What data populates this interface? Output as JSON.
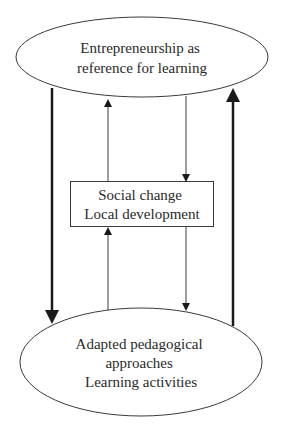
{
  "diagram": {
    "type": "cycle-flow",
    "nodes": {
      "top": {
        "shape": "ellipse",
        "lines": [
          "Entrepreneurship as",
          "reference for learning"
        ]
      },
      "middle": {
        "shape": "rectangle",
        "lines": [
          "Social change",
          "Local development"
        ]
      },
      "bottom": {
        "shape": "ellipse",
        "lines": [
          "Adapted pedagogical",
          "approaches",
          "Learning activities"
        ]
      }
    },
    "edges": [
      {
        "from": "top",
        "to": "bottom",
        "weight": "thick",
        "side": "left"
      },
      {
        "from": "bottom",
        "to": "top",
        "weight": "thick",
        "side": "right"
      },
      {
        "from": "middle",
        "to": "top",
        "weight": "thin"
      },
      {
        "from": "top",
        "to": "middle",
        "weight": "thin"
      },
      {
        "from": "bottom",
        "to": "middle",
        "weight": "thin"
      },
      {
        "from": "middle",
        "to": "bottom",
        "weight": "thin"
      }
    ],
    "colors": {
      "stroke": "#3a3a3a",
      "arrow": "#1a1a1a",
      "text": "#2a2a2a"
    }
  }
}
